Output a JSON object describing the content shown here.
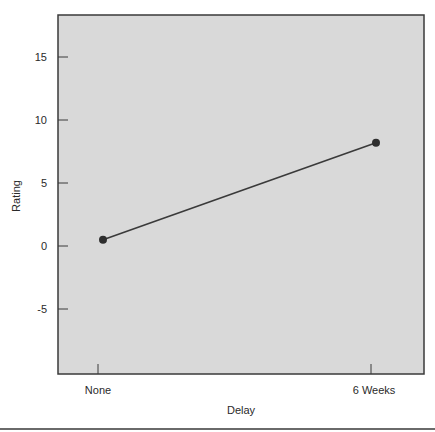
{
  "chart_data": {
    "type": "line",
    "title": "",
    "xlabel": "Delay",
    "ylabel": "Rating",
    "categories": [
      "None",
      "6 Weeks"
    ],
    "series": [
      {
        "name": "Rating",
        "values": [
          0.5,
          8.2
        ]
      }
    ],
    "ylim": [
      -9.8,
      18.5
    ],
    "yticks": [
      15,
      10,
      5,
      0,
      -5
    ],
    "ytick_labels": [
      "15",
      "10",
      "5",
      "0",
      "-5"
    ],
    "grid": false,
    "legend": null
  },
  "colors": {
    "plot_background": "#d9d9d9",
    "axis": "#3a3a3a",
    "line": "#3a3a3a",
    "marker": "#2e2e2e"
  }
}
